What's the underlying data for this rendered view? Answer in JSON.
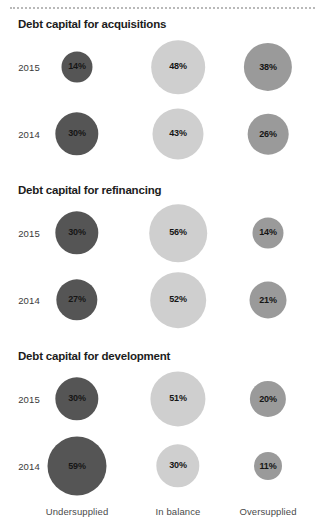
{
  "chart_data": {
    "type": "bubble",
    "title": "",
    "categories": [
      "Undersupplied",
      "In balance",
      "Oversupplied"
    ],
    "category_colors": [
      "#555555",
      "#cfcfcf",
      "#9a9a9a"
    ],
    "rows": [
      "2015",
      "2014"
    ],
    "unit": "%",
    "legend_position": "bottom-axis",
    "grid": false,
    "panels": [
      {
        "title": "Debt capital for acquisitions",
        "series": [
          {
            "name": "2015",
            "values": [
              14,
              48,
              38
            ],
            "labels": [
              "14%",
              "48%",
              "38%"
            ]
          },
          {
            "name": "2014",
            "values": [
              30,
              43,
              26
            ],
            "labels": [
              "30%",
              "43%",
              "26%"
            ]
          }
        ]
      },
      {
        "title": "Debt capital for refinancing",
        "series": [
          {
            "name": "2015",
            "values": [
              30,
              56,
              14
            ],
            "labels": [
              "30%",
              "56%",
              "14%"
            ]
          },
          {
            "name": "2014",
            "values": [
              27,
              52,
              21
            ],
            "labels": [
              "27%",
              "52%",
              "21%"
            ]
          }
        ]
      },
      {
        "title": "Debt capital for development",
        "series": [
          {
            "name": "2015",
            "values": [
              30,
              51,
              20
            ],
            "labels": [
              "30%",
              "51%",
              "20%"
            ]
          },
          {
            "name": "2014",
            "values": [
              59,
              30,
              11
            ],
            "labels": [
              "59%",
              "30%",
              "11%"
            ]
          }
        ]
      }
    ]
  },
  "layout": {
    "column_centers": [
      77,
      178,
      268
    ],
    "section_tops": [
      18,
      184,
      350
    ],
    "row_offsets": [
      49,
      116
    ],
    "axis_label_y": 506,
    "bubble_min_px": 28,
    "bubble_scale": 6.6,
    "year_label_x": 29
  }
}
